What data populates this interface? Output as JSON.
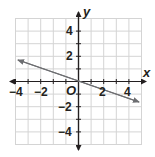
{
  "graph": {
    "type": "coordinate-plane",
    "x_axis_label": "x",
    "y_axis_label": "y",
    "origin_label": "O",
    "x_range": [
      -5,
      5
    ],
    "y_range": [
      -5,
      5
    ],
    "x_tick_labels": [
      "−4",
      "−2",
      "2",
      "4"
    ],
    "y_tick_labels": [
      "4",
      "2",
      "−2",
      "−4"
    ],
    "grid_step": 1,
    "colors": {
      "grid": "#d4d4d4",
      "axis": "#231f20",
      "line": "#6d6e71"
    },
    "line": {
      "description": "line through origin with arrows at both ends",
      "slope": -0.333,
      "y_intercept": 0,
      "from": [
        -4.8,
        1.6
      ],
      "to": [
        4.8,
        -1.6
      ]
    }
  }
}
